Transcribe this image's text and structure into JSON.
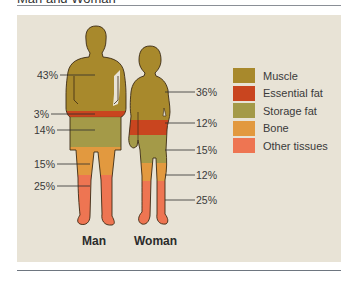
{
  "header": {
    "title": "Man and Woman"
  },
  "colors": {
    "panel_bg": "#e8e3d6",
    "muscle": "#a8892c",
    "essential_fat": "#c9451f",
    "storage_fat": "#a49a48",
    "bone": "#e2993f",
    "other_tissues": "#ee7552",
    "outline": "#3b2a14"
  },
  "legend": {
    "items": [
      {
        "key": "muscle",
        "label": "Muscle",
        "color": "#a8892c"
      },
      {
        "key": "essential_fat",
        "label": "Essential fat",
        "color": "#c9451f"
      },
      {
        "key": "storage_fat",
        "label": "Storage fat",
        "color": "#a49a48"
      },
      {
        "key": "bone",
        "label": "Bone",
        "color": "#e2993f"
      },
      {
        "key": "other_tissues",
        "label": "Other tissues",
        "color": "#ee7552"
      }
    ]
  },
  "figures": {
    "man": {
      "label": "Man",
      "percentages": [
        {
          "component": "Muscle",
          "value": "43%"
        },
        {
          "component": "Essential fat",
          "value": "3%"
        },
        {
          "component": "Storage fat",
          "value": "14%"
        },
        {
          "component": "Bone",
          "value": "15%"
        },
        {
          "component": "Other tissues",
          "value": "25%"
        }
      ]
    },
    "woman": {
      "label": "Woman",
      "percentages": [
        {
          "component": "Muscle",
          "value": "36%"
        },
        {
          "component": "Essential fat",
          "value": "12%"
        },
        {
          "component": "Storage fat",
          "value": "15%"
        },
        {
          "component": "Bone",
          "value": "12%"
        },
        {
          "component": "Other tissues",
          "value": "25%"
        }
      ]
    }
  }
}
